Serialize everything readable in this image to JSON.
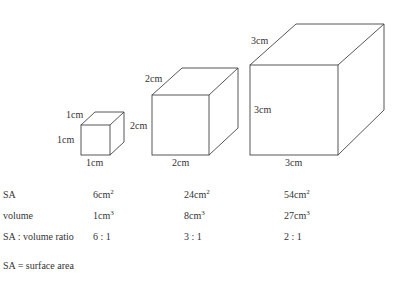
{
  "cubes": [
    {
      "side": "1cm",
      "top_label": "1cm",
      "left_label": "1cm",
      "bottom_label": "1cm"
    },
    {
      "side": "2cm",
      "top_label": "2cm",
      "left_label": "2cm",
      "bottom_label": "2cm"
    },
    {
      "side": "3cm",
      "top_label": "3cm",
      "left_label": "3cm",
      "bottom_label": "3cm"
    }
  ],
  "table": {
    "rows": [
      {
        "label": "SA",
        "values": [
          {
            "num": "6cm",
            "exp": "2"
          },
          {
            "num": "24cm",
            "exp": "2"
          },
          {
            "num": "54cm",
            "exp": "2"
          }
        ]
      },
      {
        "label": "volume",
        "values": [
          {
            "num": "1cm",
            "exp": "3"
          },
          {
            "num": "8cm",
            "exp": "3"
          },
          {
            "num": "27cm",
            "exp": "3"
          }
        ]
      },
      {
        "label": "SA : volume ratio",
        "values": [
          {
            "num": "6 : 1",
            "exp": ""
          },
          {
            "num": "3 : 1",
            "exp": ""
          },
          {
            "num": "2 : 1",
            "exp": ""
          }
        ]
      }
    ]
  },
  "footnote": "SA = surface area"
}
